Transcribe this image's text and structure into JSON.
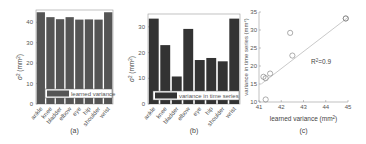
{
  "chart_data": [
    {
      "type": "bar",
      "panel": "(a)",
      "categories": [
        "ankle",
        "knee",
        "bladder",
        "elbow",
        "eye",
        "hip",
        "shoulder",
        "wrist"
      ],
      "values": [
        44.9,
        42.5,
        41.5,
        42.5,
        41.3,
        41.4,
        41.3,
        44.9
      ],
      "legend": "learned variance",
      "xlabel": "",
      "ylabel": "σ² (mm²)",
      "yticks": [
        0,
        10,
        20,
        30,
        40
      ],
      "ylim": [
        0,
        46
      ],
      "bar_color": "#555555"
    },
    {
      "type": "bar",
      "panel": "(b)",
      "categories": [
        "ankle",
        "knee",
        "bladder",
        "elbow",
        "eye",
        "hip",
        "shoulder",
        "wrist"
      ],
      "values": [
        33.2,
        22.9,
        10.7,
        29.2,
        17.1,
        17.9,
        16.6,
        33.2
      ],
      "legend": "variance in time series",
      "xlabel": "",
      "ylabel": "σ² (mm²)",
      "yticks": [
        0,
        10,
        20,
        30
      ],
      "ylim": [
        0,
        35
      ],
      "bar_color": "#333333"
    },
    {
      "type": "scatter",
      "panel": "(c)",
      "x": [
        41.2,
        41.3,
        41.5,
        41.3,
        42.4,
        42.5,
        44.9,
        44.9
      ],
      "y": [
        17.0,
        16.6,
        17.9,
        10.7,
        29.2,
        22.9,
        33.2,
        33.2
      ],
      "fit_line": {
        "x": [
          41.1,
          45.0
        ],
        "y": [
          15.0,
          33.5
        ]
      },
      "annotation": "R²=0.9",
      "xlabel": "learned variance (mm²)",
      "ylabel": "variance in time series (mm²)",
      "xticks": [
        41,
        42,
        43,
        44,
        45
      ],
      "yticks": [
        10,
        15,
        20,
        25,
        30,
        35
      ],
      "xlim": [
        41,
        45
      ],
      "ylim": [
        10,
        35
      ]
    }
  ],
  "captions": {
    "a": "(a)",
    "b": "(b)",
    "c": "(c)"
  },
  "ylabel_ab": "σ² (mm²)",
  "legend_a": "learned variance",
  "legend_b": "variance in time series",
  "xlabel_c": "learned variance (mm²)",
  "ylabel_c": "variance in time series (mm²)",
  "annotation_c": "R²=0.9"
}
